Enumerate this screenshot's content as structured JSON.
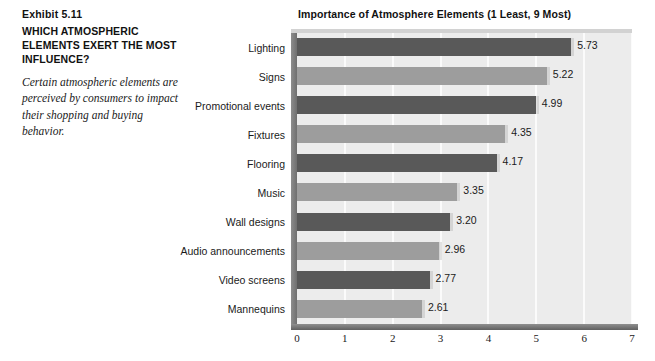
{
  "exhibit": {
    "number": "Exhibit 5.11",
    "heading": "WHICH ATMOSPHERIC ELEMENTS EXERT THE MOST INFLUENCE?",
    "caption": "Certain atmospheric elements are perceived by consumers to impact their shopping and buying behavior."
  },
  "colors": {
    "bar_dark": "#595959",
    "bar_light": "#9d9d9d",
    "plot_background": "#ececec",
    "gridline": "#fbfbfb",
    "axis": "#606060",
    "text": "#1a1a1a"
  },
  "chart_data": {
    "type": "bar",
    "orientation": "horizontal",
    "title": "Importance of Atmosphere Elements (1 Least, 9 Most)",
    "xlabel": "",
    "ylabel": "",
    "xlim": [
      0,
      7
    ],
    "xticks": [
      0,
      1,
      2,
      3,
      4,
      5,
      6,
      7
    ],
    "xtick_labels": [
      "0",
      "1",
      "2",
      "3",
      "4",
      "5",
      "6",
      "7"
    ],
    "grid": true,
    "legend": false,
    "categories": [
      "Lighting",
      "Signs",
      "Promotional events",
      "Fixtures",
      "Flooring",
      "Music",
      "Wall designs",
      "Audio announcements",
      "Video screens",
      "Mannequins"
    ],
    "values": [
      5.73,
      5.22,
      4.99,
      4.35,
      4.17,
      3.35,
      3.2,
      2.96,
      2.77,
      2.61
    ],
    "value_labels": [
      "5.73",
      "5.22",
      "4.99",
      "4.35",
      "4.17",
      "3.35",
      "3.20",
      "2.96",
      "2.77",
      "2.61"
    ],
    "bar_shades": [
      "dark",
      "light",
      "dark",
      "light",
      "dark",
      "light",
      "dark",
      "light",
      "dark",
      "light"
    ]
  }
}
